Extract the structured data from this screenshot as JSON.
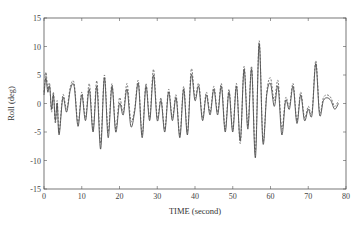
{
  "chart_data": {
    "type": "line",
    "title": "",
    "xlabel": "TIME (second)",
    "ylabel": "Roll (deg)",
    "xlim": [
      0,
      80
    ],
    "ylim": [
      -15,
      15
    ],
    "xticks": [
      0,
      10,
      20,
      30,
      40,
      50,
      60,
      70,
      80
    ],
    "yticks": [
      -15,
      -10,
      -5,
      0,
      5,
      10,
      15
    ],
    "grid": false,
    "legend": null,
    "series": [
      {
        "name": "solid",
        "style": "solid",
        "color": "#333333",
        "x": [
          0,
          0.5,
          1,
          1.5,
          2,
          2.5,
          3,
          3.5,
          4,
          5,
          6,
          7,
          8,
          9,
          10,
          11,
          12,
          13,
          14,
          15,
          16,
          17,
          18,
          19,
          20,
          21,
          22,
          23,
          24,
          25,
          26,
          27,
          28,
          29,
          30,
          31,
          32,
          33,
          34,
          35,
          36,
          37,
          38,
          39,
          40,
          41,
          42,
          43,
          44,
          45,
          46,
          47,
          48,
          49,
          50,
          51,
          52,
          53,
          54,
          55,
          56,
          57,
          58,
          59,
          60,
          61,
          62,
          63,
          64,
          65,
          66,
          67,
          68,
          69,
          70,
          71,
          72,
          73,
          74,
          75,
          76,
          77,
          78
        ],
        "y": [
          1.5,
          4.5,
          2,
          3,
          -1,
          1.5,
          -3,
          0,
          -5.5,
          1,
          -1.5,
          2.5,
          3,
          -4,
          1.5,
          -3,
          2.5,
          -5,
          3,
          -8,
          4.5,
          -6,
          3,
          -5,
          0,
          -2,
          2.5,
          -4,
          -1.5,
          3.5,
          -6,
          3,
          -3,
          5,
          -3,
          0.5,
          -5,
          2,
          -3,
          1,
          -6,
          2.5,
          -5.5,
          5,
          0.5,
          3,
          -3,
          1.5,
          -2,
          2.5,
          -2,
          3,
          -5,
          2,
          -5,
          3,
          -6.5,
          6,
          -4.5,
          6,
          -9.5,
          10.5,
          -7,
          1.5,
          3.5,
          -0.5,
          3,
          -5.5,
          0.5,
          -1,
          3,
          -3.5,
          1.5,
          -3,
          -1,
          -2,
          7,
          -2,
          0.5,
          1,
          0.5,
          -1,
          0
        ]
      },
      {
        "name": "dashed",
        "style": "dashed",
        "color": "#555555",
        "x": [
          0,
          0.5,
          1,
          1.5,
          2,
          2.5,
          3,
          3.5,
          4,
          5,
          6,
          7,
          8,
          9,
          10,
          11,
          12,
          13,
          14,
          15,
          16,
          17,
          18,
          19,
          20,
          21,
          22,
          23,
          24,
          25,
          26,
          27,
          28,
          29,
          30,
          31,
          32,
          33,
          34,
          35,
          36,
          37,
          38,
          39,
          40,
          41,
          42,
          43,
          44,
          45,
          46,
          47,
          48,
          49,
          50,
          51,
          52,
          53,
          54,
          55,
          56,
          57,
          58,
          59,
          60,
          61,
          62,
          63,
          64,
          65,
          66,
          67,
          68,
          69,
          70,
          71,
          72,
          73,
          74,
          75,
          76,
          77,
          78
        ],
        "y": [
          2,
          5.5,
          2.5,
          3.5,
          -1.5,
          2,
          -3.5,
          0.5,
          -5,
          1.5,
          -1,
          3,
          3.5,
          -3.5,
          2,
          -2.5,
          3.5,
          -4.5,
          4,
          -7,
          5,
          -5,
          3.5,
          -4.5,
          1,
          -1.5,
          3.5,
          -3,
          -1,
          4,
          -5.5,
          3.5,
          -2.5,
          6,
          -2.5,
          1,
          -4.5,
          2.5,
          -2.5,
          1.5,
          -5.5,
          3,
          -5,
          6,
          1,
          3.5,
          -2.5,
          2,
          -1.5,
          3,
          -1.5,
          3.5,
          -4.5,
          2.5,
          -4.5,
          3.5,
          -7,
          6.5,
          -4,
          6.5,
          -8.5,
          11,
          -6.5,
          2,
          4.5,
          0.5,
          4,
          -4.5,
          1,
          -0.5,
          3.5,
          -3,
          2,
          -2.5,
          -0.5,
          -1.5,
          7.5,
          -1.5,
          1,
          1.5,
          1,
          -0.5,
          0.5
        ]
      }
    ]
  },
  "axes": {
    "xlabel": "TIME (second)",
    "ylabel": "Roll (deg)",
    "xtick_labels": [
      "0",
      "10",
      "20",
      "30",
      "40",
      "50",
      "60",
      "70",
      "80"
    ],
    "ytick_labels": [
      "15",
      "10",
      "5",
      "0",
      "-5",
      "-10",
      "-15"
    ]
  }
}
